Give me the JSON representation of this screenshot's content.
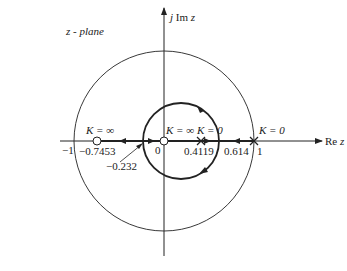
{
  "diagram": {
    "title": "z - plane",
    "axes": {
      "imag_label_j": "j",
      "imag_label_im": "Im",
      "imag_label_z": "z",
      "real_label_re": "Re",
      "real_label_z": "z"
    },
    "unit_circle_labels": {
      "minus_one": "−1",
      "one": "1",
      "origin": "0"
    },
    "zeros": [
      {
        "value": "−0.7453",
        "k_label": "K = ∞"
      },
      {
        "value": "0",
        "k_label": "K = ∞"
      }
    ],
    "poles": [
      {
        "value": "0.4119",
        "k_label": "K = 0"
      },
      {
        "value": "1",
        "k_label": "K = 0"
      }
    ],
    "breakaway_points": [
      {
        "value": "−0.232"
      },
      {
        "value": "0.614"
      }
    ],
    "colors": {
      "line": "#222222",
      "background": "#ffffff"
    }
  }
}
